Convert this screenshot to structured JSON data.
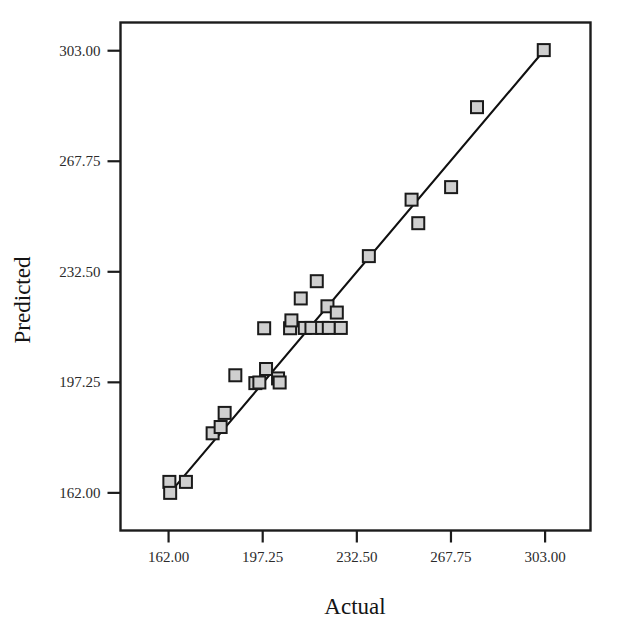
{
  "figure": {
    "background_color": "#ffffff",
    "caption_partial": ""
  },
  "chart_data": {
    "type": "scatter",
    "title": "",
    "subtitle": "",
    "xlabel": "Actual",
    "ylabel": "Predicted",
    "xlim": [
      144.0,
      320.0
    ],
    "ylim": [
      150.0,
      312.0
    ],
    "xticks": [
      162.0,
      197.25,
      232.5,
      267.75,
      303.0
    ],
    "yticks": [
      162.0,
      197.25,
      232.5,
      267.75,
      303.0
    ],
    "xticklabels": [
      "162.00",
      "197.25",
      "232.50",
      "267.75",
      "303.00"
    ],
    "yticklabels": [
      "162.00",
      "197.25",
      "232.50",
      "267.75",
      "303.00"
    ],
    "grid": false,
    "legend": null,
    "marker_style": "square",
    "marker_fill": "#cfcfcf",
    "marker_edge": "#1a1a1a",
    "marker_size_px": 12,
    "series": [
      {
        "name": "Predicted vs Actual",
        "points": [
          [
            162.3,
            165.5
          ],
          [
            162.6,
            162.0
          ],
          [
            168.5,
            165.5
          ],
          [
            178.5,
            181.0
          ],
          [
            181.5,
            183.0
          ],
          [
            183.0,
            187.5
          ],
          [
            187.0,
            199.5
          ],
          [
            194.5,
            197.0
          ],
          [
            196.0,
            197.2
          ],
          [
            198.5,
            201.5
          ],
          [
            197.8,
            214.5
          ],
          [
            203.0,
            198.5
          ],
          [
            203.6,
            197.2
          ],
          [
            207.5,
            214.5
          ],
          [
            208.0,
            217.0
          ],
          [
            211.5,
            224.0
          ],
          [
            213.0,
            214.6
          ],
          [
            215.5,
            214.6
          ],
          [
            217.5,
            229.5
          ],
          [
            219.5,
            214.6
          ],
          [
            221.5,
            221.5
          ],
          [
            222.0,
            214.6
          ],
          [
            225.0,
            219.5
          ],
          [
            226.5,
            214.6
          ],
          [
            237.0,
            237.5
          ],
          [
            253.0,
            255.5
          ],
          [
            255.5,
            248.0
          ],
          [
            267.8,
            259.5
          ],
          [
            277.5,
            285.0
          ],
          [
            302.5,
            303.2
          ]
        ]
      }
    ],
    "fit_line": {
      "label": "reference line",
      "x_start": 162.0,
      "y_start": 161.5,
      "x_end": 302.5,
      "y_end": 303.0,
      "color": "#101010"
    }
  },
  "axes": {
    "x_axis_name": "actual-axis",
    "y_axis_name": "predicted-axis"
  }
}
